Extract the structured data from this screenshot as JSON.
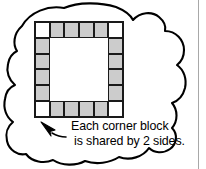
{
  "figure": {
    "kind": "callout-illustration",
    "background_color": "#ffffff",
    "outline_color": "#000000"
  },
  "callout": {
    "shape_name": "cloud-bubble",
    "fill_color": "#ffffff",
    "stroke_color": "#000000"
  },
  "block_ring": {
    "title": "square block border",
    "columns": 6,
    "rows": 6,
    "filled_color": "#cccccc",
    "corner_color": "#ffffff",
    "outline_color": "#1a1a1a",
    "corner_count": 4,
    "edge_block_count": 16,
    "total_border_blocks": 20,
    "cells": [
      [
        "corner",
        "filled",
        "filled",
        "filled",
        "filled",
        "corner"
      ],
      [
        "filled",
        "hollow",
        "hollow",
        "hollow",
        "hollow",
        "filled"
      ],
      [
        "filled",
        "hollow",
        "hollow",
        "hollow",
        "hollow",
        "filled"
      ],
      [
        "filled",
        "hollow",
        "hollow",
        "hollow",
        "hollow",
        "filled"
      ],
      [
        "filled",
        "hollow",
        "hollow",
        "hollow",
        "hollow",
        "filled"
      ],
      [
        "corner",
        "filled",
        "filled",
        "filled",
        "filled",
        "corner"
      ]
    ]
  },
  "annotation": {
    "arrow_name": "pointer-arrow",
    "arrow_direction": "up-left",
    "caption_line_1": "Each corner block",
    "caption_line_2": "is shared by 2 sides.",
    "text_color": "#000000"
  },
  "page": {
    "rule_color": "#a8a8a8"
  }
}
